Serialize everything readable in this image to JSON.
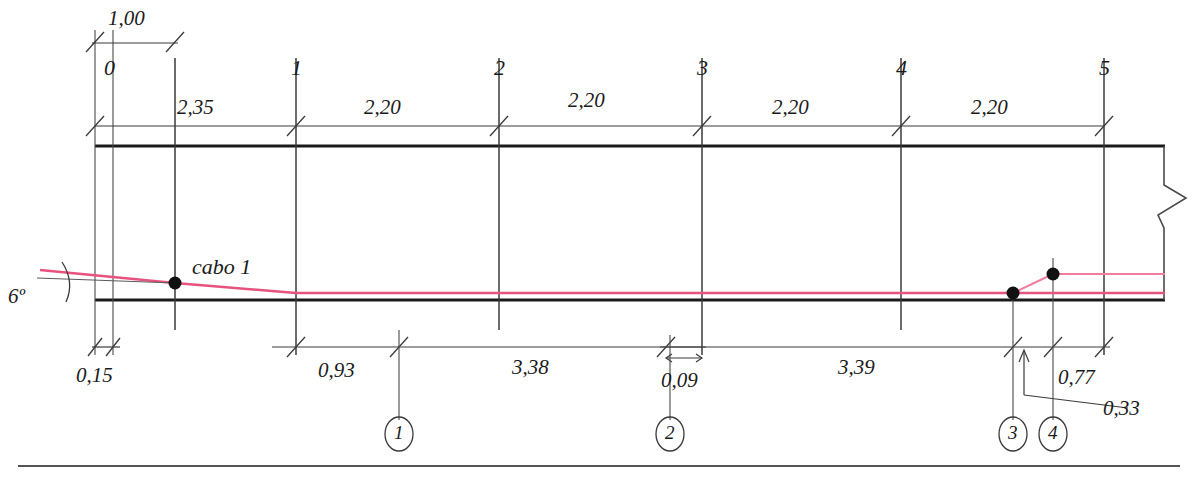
{
  "drawing": {
    "title": "Beam elevation with prestressing cable layout",
    "colors": {
      "line": "#1a1a1a",
      "thin": "#4a4a4a",
      "cable": "#e8527f",
      "background": "#ffffff"
    },
    "cable_label": "cabo 1",
    "angle_label": "6º"
  },
  "top_dimension_chain": {
    "span_label": "1,00",
    "segments": [
      {
        "label": "2,35",
        "from": "0",
        "to": "1"
      },
      {
        "label": "2,20",
        "from": "1",
        "to": "2"
      },
      {
        "label": "2,20",
        "from": "2",
        "to": "3"
      },
      {
        "label": "2,20",
        "from": "3",
        "to": "4"
      },
      {
        "label": "2,20",
        "from": "4",
        "to": "5"
      }
    ]
  },
  "grid_labels": [
    "0",
    "1",
    "2",
    "3",
    "4",
    "5"
  ],
  "bottom_dimension_chain": {
    "segments": [
      "0,15",
      "0,93",
      "3,38",
      "0,09",
      "3,39",
      "0,77",
      "0,33"
    ]
  },
  "bottom_left_dim": "0,15",
  "bottom_segments": [
    {
      "label": "0,93"
    },
    {
      "label": "3,38"
    },
    {
      "label": "0,09"
    },
    {
      "label": "3,39"
    },
    {
      "label": "0,77"
    },
    {
      "label": "0,33"
    }
  ],
  "anchor_points": [
    {
      "id": "1",
      "label": "1"
    },
    {
      "id": "2",
      "label": "2"
    },
    {
      "id": "3",
      "label": "3"
    },
    {
      "id": "4",
      "label": "4"
    }
  ]
}
